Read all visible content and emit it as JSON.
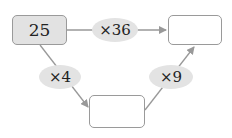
{
  "diagram": {
    "start_box": {
      "value": "25"
    },
    "result_box_top": {
      "value": ""
    },
    "result_box_bottom": {
      "value": ""
    },
    "operators": {
      "top": "×36",
      "left": "×4",
      "right": "×9"
    }
  },
  "colors": {
    "start_fill": "#e2e2e2",
    "oval_fill": "#e3e3e3",
    "line": "#999999"
  }
}
